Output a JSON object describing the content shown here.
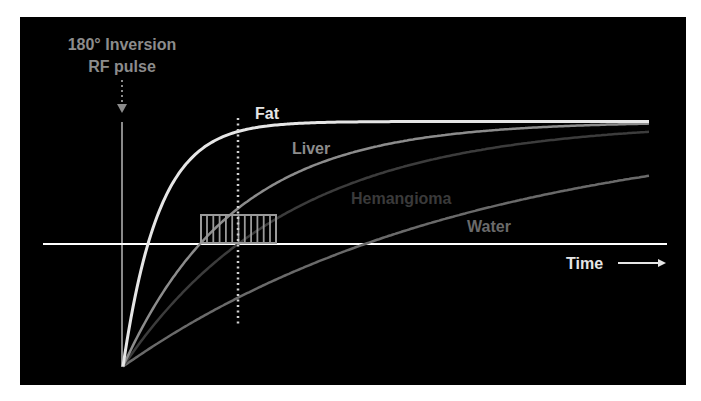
{
  "annotation": {
    "line1": "180° Inversion",
    "line2": "RF pulse",
    "color": "#8c8c8c"
  },
  "axis": {
    "time_label": "Time",
    "time_arrow": "⟶",
    "baseline_color": "#ffffff",
    "pulse_line_color": "#8a8a8a"
  },
  "labels": {
    "fat": "Fat",
    "liver": "Liver",
    "hemangioma": "Hemangioma",
    "water": "Water"
  },
  "colors": {
    "fat": "#e6e6e6",
    "liver": "#8c8c8c",
    "hemangioma": "#3c3c3c",
    "water": "#6a6a6a",
    "background": "#000000"
  },
  "chart_data": {
    "type": "line",
    "xlabel": "Time",
    "ylabel": "",
    "model": "M(t) = 1 - 2*exp(-t/T1)",
    "series": [
      {
        "name": "Fat",
        "T1_px": 36,
        "null_point_px": 25
      },
      {
        "name": "Liver",
        "T1_px": 111,
        "null_point_px": 77
      },
      {
        "name": "Hemangioma",
        "T1_px": 166,
        "null_point_px": 115
      },
      {
        "name": "Water",
        "T1_px": 349,
        "null_point_px": 242
      }
    ],
    "annotations": [
      "180° Inversion RF pulse",
      "inversion time marker (dotted vertical line)",
      "acquisition window (hatched box)"
    ],
    "ylim": [
      -1,
      1
    ],
    "grid": false
  }
}
